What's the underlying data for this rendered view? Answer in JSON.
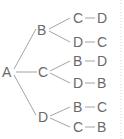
{
  "diagram": {
    "type": "tree-diagram",
    "root": "A",
    "level1": [
      "B",
      "C",
      "D"
    ],
    "branches": [
      {
        "parent": "B",
        "paths": [
          [
            "C",
            "D"
          ],
          [
            "D",
            "C"
          ]
        ]
      },
      {
        "parent": "C",
        "paths": [
          [
            "B",
            "D"
          ],
          [
            "D",
            "B"
          ]
        ]
      },
      {
        "parent": "D",
        "paths": [
          [
            "B",
            "C"
          ],
          [
            "C",
            "B"
          ]
        ]
      }
    ],
    "labels": {
      "root": "A",
      "n1": "B",
      "n2": "C",
      "n3": "D",
      "r1a": "C",
      "r1b": "D",
      "r2a": "D",
      "r2b": "C",
      "r3a": "B",
      "r3b": "D",
      "r4a": "D",
      "r4b": "B",
      "r5a": "B",
      "r5b": "C",
      "r6a": "C",
      "r6b": "B"
    },
    "colors": {
      "text": "#6a6a6a",
      "line": "#9a9a9a"
    }
  }
}
